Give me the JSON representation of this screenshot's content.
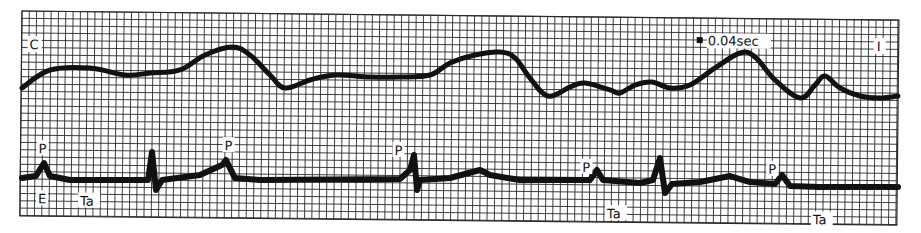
{
  "figure": {
    "grid": {
      "left": 22,
      "top": 11,
      "right": 899,
      "bottom": 216,
      "cell": 7.3,
      "rotation_deg": 0.6,
      "line_color": "#2a2a2a",
      "paper_color": "#ffffff"
    },
    "labels": {
      "upper_lead": "C",
      "lower_lead": "I",
      "scale": "0.04sec",
      "p1": "P",
      "p2": "P",
      "p3": "P",
      "p4": "P",
      "p5": "P",
      "e": "E",
      "ta1": "Ta",
      "ta2": "Ta",
      "ta3": "Ta"
    },
    "trace_color": "#111111"
  },
  "chart_data": [
    {
      "type": "line",
      "title": "Upper tracing (C)",
      "series": [
        {
          "name": "upper-trace",
          "points": [
            [
              22,
              88
            ],
            [
              50,
              70
            ],
            [
              90,
              68
            ],
            [
              125,
              75
            ],
            [
              150,
              73
            ],
            [
              180,
              70
            ],
            [
              205,
              55
            ],
            [
              232,
              47
            ],
            [
              250,
              55
            ],
            [
              270,
              75
            ],
            [
              285,
              88
            ],
            [
              310,
              80
            ],
            [
              335,
              75
            ],
            [
              370,
              77
            ],
            [
              400,
              77
            ],
            [
              430,
              75
            ],
            [
              450,
              63
            ],
            [
              475,
              55
            ],
            [
              500,
              52
            ],
            [
              515,
              58
            ],
            [
              530,
              78
            ],
            [
              548,
              96
            ],
            [
              570,
              87
            ],
            [
              585,
              83
            ],
            [
              610,
              90
            ],
            [
              620,
              93
            ],
            [
              635,
              85
            ],
            [
              652,
              82
            ],
            [
              670,
              88
            ],
            [
              690,
              85
            ],
            [
              715,
              68
            ],
            [
              740,
              53
            ],
            [
              755,
              57
            ],
            [
              775,
              80
            ],
            [
              800,
              98
            ],
            [
              815,
              85
            ],
            [
              825,
              76
            ],
            [
              840,
              88
            ],
            [
              860,
              96
            ],
            [
              880,
              98
            ],
            [
              898,
              96
            ]
          ]
        }
      ],
      "annotations": [
        "C",
        "0.04sec",
        "I"
      ]
    },
    {
      "type": "line",
      "title": "Lower tracing (ECG)",
      "series": [
        {
          "name": "lower-trace",
          "points": [
            [
              22,
              178
            ],
            [
              36,
              176
            ],
            [
              44,
              163
            ],
            [
              50,
              176
            ],
            [
              70,
              180
            ],
            [
              148,
              180
            ],
            [
              152,
              152
            ],
            [
              156,
              190
            ],
            [
              162,
              180
            ],
            [
              200,
              175
            ],
            [
              222,
              165
            ],
            [
              226,
              160
            ],
            [
              235,
              178
            ],
            [
              260,
              180
            ],
            [
              400,
              179
            ],
            [
              410,
              170
            ],
            [
              414,
              155
            ],
            [
              417,
              190
            ],
            [
              420,
              180
            ],
            [
              450,
              178
            ],
            [
              480,
              170
            ],
            [
              490,
              175
            ],
            [
              520,
              180
            ],
            [
              590,
              180
            ],
            [
              597,
              170
            ],
            [
              603,
              180
            ],
            [
              640,
              183
            ],
            [
              653,
              180
            ],
            [
              660,
              158
            ],
            [
              665,
              193
            ],
            [
              672,
              184
            ],
            [
              700,
              182
            ],
            [
              730,
              176
            ],
            [
              750,
              182
            ],
            [
              775,
              184
            ],
            [
              782,
              175
            ],
            [
              790,
              186
            ],
            [
              820,
              187
            ],
            [
              898,
              187
            ]
          ]
        }
      ],
      "annotations": [
        "P",
        "E",
        "Ta",
        "P",
        "P",
        "P",
        "Ta",
        "P",
        "Ta"
      ]
    }
  ]
}
